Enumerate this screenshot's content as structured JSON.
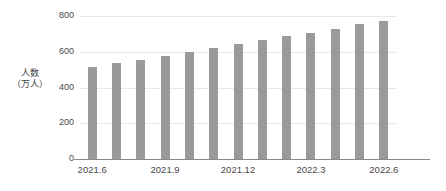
{
  "chart_data": {
    "type": "bar",
    "title": "",
    "subtitle": "",
    "xlabel": "",
    "ylabel": "人数（万人）",
    "ylabel_lines": [
      "人数",
      "（万人）"
    ],
    "categories": [
      "2021.6",
      "2021.7",
      "2021.8",
      "2021.9",
      "2021.10",
      "2021.11",
      "2021.12",
      "2022.1",
      "2022.2",
      "2022.3",
      "2022.4",
      "2022.5",
      "2022.6"
    ],
    "values": [
      515,
      535,
      553,
      575,
      600,
      620,
      643,
      665,
      688,
      707,
      730,
      755,
      772
    ],
    "ylim": [
      0,
      800
    ],
    "yticks": [
      0,
      200,
      400,
      600,
      800
    ],
    "ytick_labels": [
      "0",
      "200",
      "400",
      "600",
      "800"
    ],
    "visible_xtick_labels": [
      "2021.6",
      "2021.9",
      "2021.12",
      "2022.3",
      "2022.6"
    ],
    "visible_xtick_indices": [
      0,
      3,
      6,
      9,
      12
    ],
    "grid": true,
    "grid_axis": "y",
    "legend": false,
    "legend_position": "none",
    "bar_color": "#9a9a9a",
    "grid_color": "#e8e8e8",
    "axis_color": "#8a8a8a",
    "text_color": "#4a4a4a",
    "background": "#ffffff"
  }
}
